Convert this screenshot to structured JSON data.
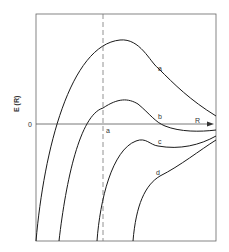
{
  "diagram": {
    "type": "potential-energy-curves",
    "y_axis_label": "E (R)",
    "zero_label": "0",
    "x_axis_label": "R",
    "dashed_marker_label": "a",
    "curves": [
      {
        "id": "a",
        "label": "a"
      },
      {
        "id": "b",
        "label": "b"
      },
      {
        "id": "c",
        "label": "c"
      },
      {
        "id": "d",
        "label": "d"
      }
    ],
    "colors": {
      "line": "#1a1a1a",
      "frame": "#555555",
      "background": "#ffffff"
    }
  }
}
